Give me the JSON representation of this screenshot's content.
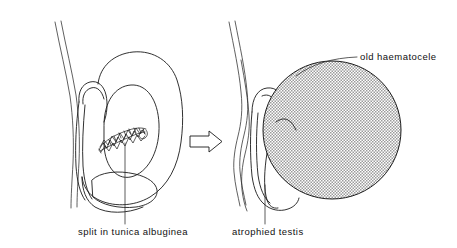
{
  "figure": {
    "type": "medical-line-diagram",
    "background_color": "#ffffff",
    "line_color": "#1a1a1a",
    "fill_color": "#b8b8b8",
    "width": 457,
    "height": 248,
    "panels": [
      {
        "name": "before",
        "description": "scrotal contents with split in tunica albuginea"
      },
      {
        "name": "after",
        "description": "atrophied testis with old haematocele"
      }
    ],
    "transition_icon": "right-arrow-icon"
  },
  "labels": {
    "split": "split in tunica albuginea",
    "atrophied": "atrophied  testis",
    "haematocele": "old haematocele"
  }
}
